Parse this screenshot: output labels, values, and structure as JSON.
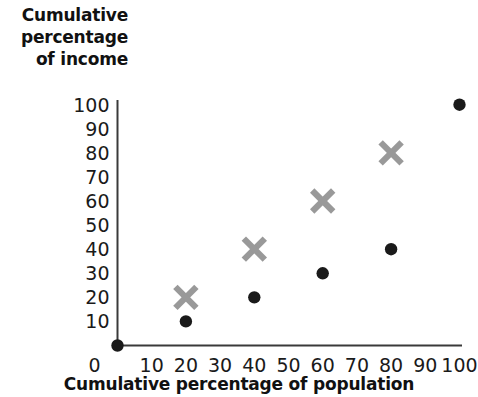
{
  "chart_data": {
    "type": "scatter",
    "title": "",
    "xlabel": "Cumulative percentage of population",
    "ylabel": "Cumulative percentage of income",
    "ylabel_lines": [
      "Cumulative",
      "percentage",
      "of income"
    ],
    "xlim": [
      0,
      100
    ],
    "ylim": [
      0,
      100
    ],
    "xticks": [
      0,
      10,
      20,
      30,
      40,
      50,
      60,
      70,
      80,
      90,
      100
    ],
    "yticks": [
      10,
      20,
      30,
      40,
      50,
      60,
      70,
      80,
      90,
      100
    ],
    "xtick_labels": [
      "0",
      "10",
      "20",
      "30",
      "40",
      "50",
      "60",
      "70",
      "80",
      "90",
      "100"
    ],
    "ytick_labels": [
      "10",
      "20",
      "30",
      "40",
      "50",
      "60",
      "70",
      "80",
      "90",
      "100"
    ],
    "grid": false,
    "legend": false,
    "legend_position": "none",
    "axis_color": "#3a3a3a",
    "series": [
      {
        "name": "series-dot",
        "marker": "circle",
        "color": "#1a1a1a",
        "points": [
          {
            "x": 0,
            "y": 0
          },
          {
            "x": 20,
            "y": 10
          },
          {
            "x": 40,
            "y": 20
          },
          {
            "x": 60,
            "y": 30
          },
          {
            "x": 80,
            "y": 40
          },
          {
            "x": 100,
            "y": 100
          }
        ]
      },
      {
        "name": "series-cross",
        "marker": "x",
        "color": "#999999",
        "points": [
          {
            "x": 20,
            "y": 20
          },
          {
            "x": 40,
            "y": 40
          },
          {
            "x": 60,
            "y": 60
          },
          {
            "x": 80,
            "y": 80
          }
        ]
      }
    ]
  }
}
